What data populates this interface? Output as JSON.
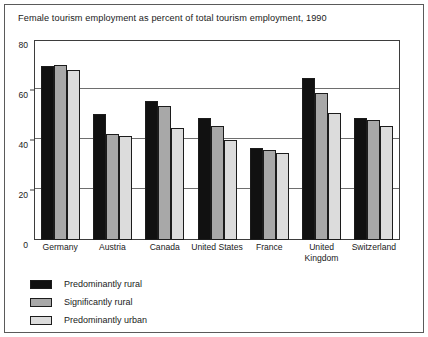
{
  "chart_data": {
    "type": "bar",
    "title": "Female tourism employment as percent of total tourism employment, 1990",
    "xlabel": "",
    "ylabel": "",
    "ylim": [
      0,
      80
    ],
    "yticks": [
      0,
      20,
      40,
      60,
      80
    ],
    "ytick_labels": [
      "0",
      "20",
      "40",
      "60",
      "80"
    ],
    "grid": true,
    "legend_position": "below-left",
    "categories": [
      "Germany",
      "Austria",
      "Canada",
      "United States",
      "France",
      "United Kingdom",
      "Switzerland"
    ],
    "series": [
      {
        "name": "Predominantly rural",
        "color": "#111111",
        "values": [
          69.5,
          50.5,
          55.5,
          49.0,
          37.0,
          65.0,
          49.0
        ]
      },
      {
        "name": "Significantly rural",
        "color": "#a8a8a8",
        "values": [
          70.0,
          42.5,
          53.5,
          45.5,
          36.0,
          59.0,
          48.0
        ]
      },
      {
        "name": "Predominantly urban",
        "color": "#dcdcdc",
        "values": [
          68.0,
          41.5,
          45.0,
          40.0,
          35.0,
          51.0,
          45.5
        ]
      }
    ]
  },
  "legend": {
    "items": [
      {
        "label": "Predominantly rural",
        "color": "#111111"
      },
      {
        "label": "Significantly rural",
        "color": "#a8a8a8"
      },
      {
        "label": "Predominantly urban",
        "color": "#dcdcdc"
      }
    ]
  }
}
